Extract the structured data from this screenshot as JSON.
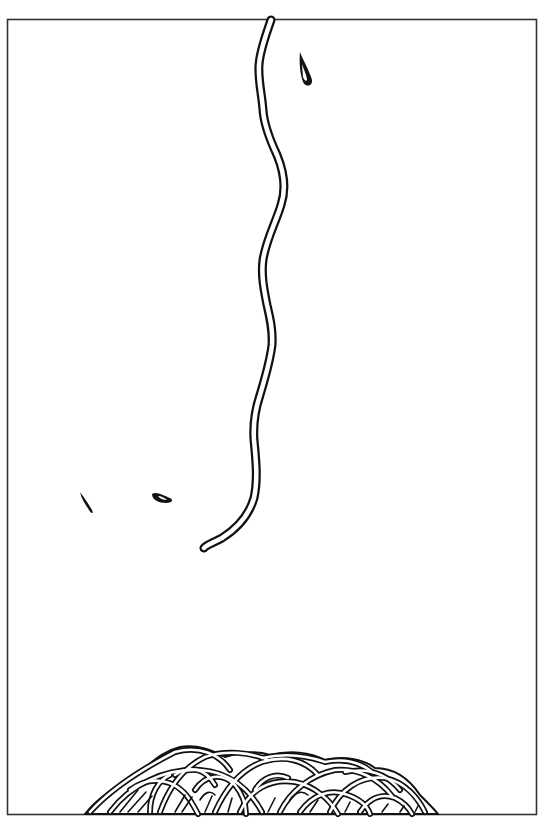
{
  "illustration": {
    "subject": "single noodle strand hanging above a pile of noodles",
    "colors": {
      "background": "#ffffff",
      "ink": "#111111",
      "frame": "#333333"
    },
    "frame": {
      "x": 7,
      "y": 19,
      "width": 530,
      "height": 796
    },
    "elements": [
      {
        "name": "hanging-noodle",
        "type": "wavy strand"
      },
      {
        "name": "drop-top-right",
        "type": "droplet"
      },
      {
        "name": "drop-left",
        "type": "droplet"
      },
      {
        "name": "drop-middle",
        "type": "droplet"
      },
      {
        "name": "noodle-pile",
        "type": "tangled pile"
      }
    ]
  }
}
